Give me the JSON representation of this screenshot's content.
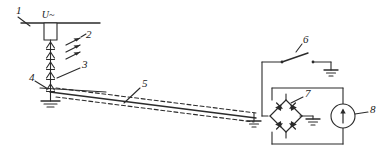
{
  "diagram": {
    "type": "electrical-schematic",
    "background_color": "#ffffff",
    "line_color": "#2b2b2b",
    "canvas": {
      "width": 391,
      "height": 160
    }
  },
  "source_label": {
    "text": "U~",
    "meaning": "ac-supply-voltage"
  },
  "callouts": [
    {
      "id": "1",
      "text": "1",
      "target": "busbar",
      "x": 16,
      "y": 14
    },
    {
      "id": "2",
      "text": "2",
      "target": "spark-arrows",
      "x": 84,
      "y": 40
    },
    {
      "id": "3",
      "text": "3",
      "target": "lower-spark-gap",
      "x": 78,
      "y": 66
    },
    {
      "id": "4",
      "text": "4",
      "target": "left-ground",
      "x": 31,
      "y": 79
    },
    {
      "id": "5",
      "text": "5",
      "target": "shielded-cable",
      "x": 141,
      "y": 85
    },
    {
      "id": "6",
      "text": "6",
      "target": "switch",
      "x": 299,
      "y": 46
    },
    {
      "id": "7",
      "text": "7",
      "target": "diode-bridge",
      "x": 305,
      "y": 96
    },
    {
      "id": "8",
      "text": "8",
      "target": "current-meter",
      "x": 372,
      "y": 111
    }
  ],
  "components": [
    {
      "name": "busbar",
      "label": "1",
      "description": "horizontal supply busbar"
    },
    {
      "name": "source-block",
      "label": "U~",
      "description": "ac source terminal block"
    },
    {
      "name": "spark-gap-chain",
      "label": "3",
      "description": "vertical chain of spark gap arrowheads"
    },
    {
      "name": "spark-arrows",
      "label": "2",
      "description": "three parallel discharge arrows"
    },
    {
      "name": "left-ground",
      "label": "4",
      "description": "earth / ground connection at sending end"
    },
    {
      "name": "shielded-cable",
      "label": "5",
      "description": "shielded coaxial cable run, dashed shield"
    },
    {
      "name": "switch",
      "label": "6",
      "description": "single pole open knife switch"
    },
    {
      "name": "diode-bridge",
      "label": "7",
      "description": "four diode full wave bridge rectifier"
    },
    {
      "name": "current-meter",
      "label": "8",
      "description": "circular meter with upward arrow"
    }
  ],
  "grounds": [
    {
      "name": "ground-left",
      "x": 47,
      "y": 100
    },
    {
      "name": "ground-switch",
      "x": 331,
      "y": 64
    },
    {
      "name": "ground-cable-end",
      "x": 254,
      "y": 120
    },
    {
      "name": "ground-bridge",
      "x": 313,
      "y": 119
    }
  ]
}
